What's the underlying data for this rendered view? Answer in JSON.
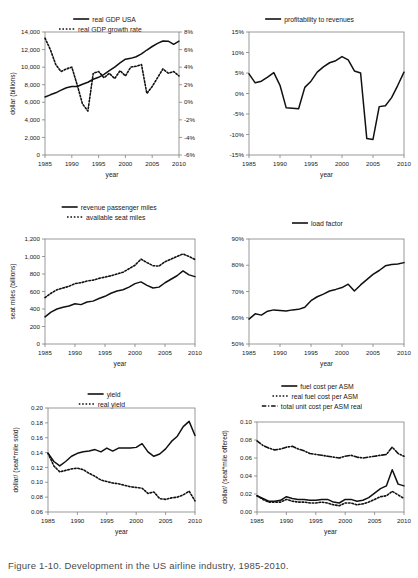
{
  "figure": {
    "caption": "Figure 1-10. Development in the US airline industry, 1985-2010.",
    "background": "#ffffff",
    "line_color": "#111111",
    "axis_color": "#808080",
    "panel_count": 6
  },
  "common": {
    "xlabel": "year",
    "xticks": [
      "1985",
      "1990",
      "1995",
      "2000",
      "2005",
      "2010"
    ],
    "xlim": [
      1985,
      2010
    ]
  },
  "chart_data": [
    {
      "id": "gdp",
      "type": "line",
      "title": "",
      "xlabel": "year",
      "ylabel": "dollar (billions)",
      "y2label": "",
      "xlim": [
        1985,
        2010
      ],
      "ylim": [
        0,
        14000
      ],
      "y2lim": [
        -6,
        8
      ],
      "yticks": [
        "0",
        "2,000",
        "4,000",
        "6,000",
        "8,000",
        "10,000",
        "12,000",
        "14,000"
      ],
      "y2ticks": [
        "-6%",
        "-4%",
        "-2%",
        "0%",
        "2%",
        "4%",
        "6%",
        "8%"
      ],
      "xticks": [
        "1985",
        "1990",
        "1995",
        "2000",
        "2005",
        "2010"
      ],
      "grid": false,
      "legend_position": "top",
      "legend": [
        {
          "label": "real GDP USA",
          "style": "solid",
          "axis": "left"
        },
        {
          "label": "real GDP growth rate",
          "style": "dotted",
          "axis": "right"
        }
      ],
      "x": [
        1985,
        1986,
        1987,
        1988,
        1989,
        1990,
        1991,
        1992,
        1993,
        1994,
        1995,
        1996,
        1997,
        1998,
        1999,
        2000,
        2001,
        2002,
        2003,
        2004,
        2005,
        2006,
        2007,
        2008,
        2009,
        2010
      ],
      "series": [
        {
          "name": "real GDP USA",
          "style": "solid",
          "axis": "left",
          "values": [
            6600,
            6850,
            7080,
            7380,
            7650,
            7800,
            7790,
            8060,
            8280,
            8620,
            8840,
            9180,
            9590,
            10010,
            10480,
            10900,
            11000,
            11180,
            11500,
            11950,
            12350,
            12700,
            12980,
            12950,
            12600,
            12950
          ]
        },
        {
          "name": "real GDP growth rate",
          "style": "dotted",
          "axis": "right",
          "values": [
            7.3,
            6.0,
            4.3,
            3.5,
            3.8,
            4.0,
            2.0,
            -0.2,
            -1.0,
            3.3,
            3.5,
            2.8,
            3.3,
            2.7,
            3.6,
            3.0,
            4.0,
            4.1,
            4.3,
            1.0,
            1.8,
            2.8,
            3.8,
            3.3,
            3.5,
            3.0
          ]
        }
      ],
      "series_note": "growth rate series plotted as dotted markers against right axis"
    },
    {
      "id": "profitability",
      "type": "line",
      "title": "",
      "xlabel": "year",
      "ylabel": "",
      "xlim": [
        1985,
        2010
      ],
      "ylim": [
        -15,
        15
      ],
      "yticks": [
        "-15%",
        "-10%",
        "-5%",
        "0%",
        "5%",
        "10%",
        "15%"
      ],
      "xticks": [
        "1985",
        "1990",
        "1995",
        "2000",
        "2005",
        "2010"
      ],
      "grid": false,
      "legend_position": "top",
      "legend": [
        {
          "label": "profitability to revenues",
          "style": "solid"
        }
      ],
      "x": [
        1985,
        1986,
        1987,
        1988,
        1989,
        1990,
        1991,
        1992,
        1993,
        1994,
        1995,
        1996,
        1997,
        1998,
        1999,
        2000,
        2001,
        2002,
        2003,
        2004,
        2005,
        2006,
        2007,
        2008,
        2009,
        2010
      ],
      "series": [
        {
          "name": "profitability to revenues",
          "style": "solid",
          "values": [
            4.8,
            2.6,
            3.0,
            4.0,
            5.1,
            2.0,
            -3.5,
            -3.6,
            -3.7,
            1.5,
            3.0,
            5.2,
            6.5,
            7.5,
            8.0,
            9.0,
            8.2,
            5.5,
            5.0,
            -11.0,
            -11.2,
            -3.2,
            -3.0,
            -1.0,
            2.0,
            5.2,
            3.0,
            -3.8,
            -0.2,
            1.2
          ]
        }
      ]
    },
    {
      "id": "traffic",
      "type": "line",
      "title": "",
      "xlabel": "year",
      "ylabel": "seat miles (billions)",
      "xlim": [
        1985,
        2010
      ],
      "ylim": [
        0,
        1200
      ],
      "yticks": [
        "0",
        "200",
        "400",
        "600",
        "800",
        "1,000",
        "1,200"
      ],
      "xticks": [
        "1985",
        "1990",
        "1995",
        "2000",
        "2005",
        "2010"
      ],
      "grid": false,
      "legend_position": "top",
      "legend": [
        {
          "label": "revenue passenger miles",
          "style": "solid"
        },
        {
          "label": "available seat miles",
          "style": "dotted"
        }
      ],
      "x": [
        1985,
        1986,
        1987,
        1988,
        1989,
        1990,
        1991,
        1992,
        1993,
        1994,
        1995,
        1996,
        1997,
        1998,
        1999,
        2000,
        2001,
        2002,
        2003,
        2004,
        2005,
        2006,
        2007,
        2008,
        2009,
        2010
      ],
      "series": [
        {
          "name": "revenue passenger miles",
          "style": "solid",
          "values": [
            310,
            365,
            400,
            420,
            435,
            460,
            450,
            480,
            490,
            520,
            545,
            580,
            605,
            620,
            650,
            690,
            710,
            670,
            640,
            650,
            700,
            740,
            780,
            835,
            790,
            770
          ]
        },
        {
          "name": "available seat miles",
          "style": "dotted",
          "values": [
            530,
            580,
            620,
            640,
            660,
            690,
            700,
            720,
            730,
            750,
            765,
            780,
            800,
            820,
            860,
            900,
            970,
            930,
            895,
            890,
            940,
            970,
            1000,
            1030,
            1000,
            965
          ]
        }
      ]
    },
    {
      "id": "loadfactor",
      "type": "line",
      "title": "",
      "xlabel": "year",
      "ylabel": "",
      "xlim": [
        1985,
        2010
      ],
      "ylim": [
        50,
        90
      ],
      "yticks": [
        "50%",
        "60%",
        "70%",
        "80%",
        "90%"
      ],
      "xticks": [
        "1985",
        "1990",
        "1995",
        "2000",
        "2005",
        "2010"
      ],
      "grid": false,
      "legend_position": "top",
      "legend": [
        {
          "label": "load factor",
          "style": "solid"
        }
      ],
      "x": [
        1985,
        1986,
        1987,
        1988,
        1989,
        1990,
        1991,
        1992,
        1993,
        1994,
        1995,
        1996,
        1997,
        1998,
        1999,
        2000,
        2001,
        2002,
        2003,
        2004,
        2005,
        2006,
        2007,
        2008,
        2009,
        2010
      ],
      "series": [
        {
          "name": "load factor",
          "style": "solid",
          "values": [
            59.5,
            61.5,
            61.0,
            62.5,
            63.0,
            62.8,
            62.6,
            63.0,
            63.2,
            64.0,
            66.5,
            68.0,
            69.0,
            70.2,
            70.8,
            71.5,
            72.8,
            70.2,
            72.5,
            74.5,
            76.5,
            78.0,
            79.8,
            80.3,
            80.5,
            81.0
          ]
        }
      ]
    },
    {
      "id": "yield",
      "type": "line",
      "title": "",
      "xlabel": "year",
      "ylabel": "dollar/ (seat*mile sold)",
      "xlim": [
        1985,
        2010
      ],
      "ylim": [
        0.06,
        0.2
      ],
      "yticks": [
        "0.06",
        "0.08",
        "0.10",
        "0.12",
        "0.14",
        "0.16",
        "0.18",
        "0.20"
      ],
      "xticks": [
        "1985",
        "1990",
        "1995",
        "2000",
        "2005",
        "2010"
      ],
      "grid": false,
      "legend_position": "top",
      "legend": [
        {
          "label": "yield",
          "style": "solid"
        },
        {
          "label": "real yield",
          "style": "dotted"
        }
      ],
      "x": [
        1985,
        1986,
        1987,
        1988,
        1989,
        1990,
        1991,
        1992,
        1993,
        1994,
        1995,
        1996,
        1997,
        1998,
        1999,
        2000,
        2001,
        2002,
        2003,
        2004,
        2005,
        2006,
        2007,
        2008,
        2009,
        2010
      ],
      "series": [
        {
          "name": "yield",
          "style": "solid",
          "values": [
            0.139,
            0.128,
            0.122,
            0.128,
            0.135,
            0.139,
            0.141,
            0.142,
            0.144,
            0.141,
            0.146,
            0.142,
            0.146,
            0.146,
            0.146,
            0.147,
            0.152,
            0.141,
            0.135,
            0.138,
            0.145,
            0.155,
            0.162,
            0.175,
            0.182,
            0.163
          ]
        },
        {
          "name": "real yield",
          "style": "dotted",
          "values": [
            0.139,
            0.122,
            0.114,
            0.116,
            0.118,
            0.119,
            0.117,
            0.112,
            0.108,
            0.103,
            0.101,
            0.099,
            0.098,
            0.096,
            0.094,
            0.093,
            0.092,
            0.085,
            0.087,
            0.078,
            0.077,
            0.079,
            0.08,
            0.083,
            0.088,
            0.075
          ]
        }
      ]
    },
    {
      "id": "cost",
      "type": "line",
      "title": "",
      "xlabel": "year",
      "ylabel": "dollar/ (seat*mile offered)",
      "xlim": [
        1985,
        2010
      ],
      "ylim": [
        0.0,
        0.1
      ],
      "yticks": [
        "0.00",
        "0.02",
        "0.04",
        "0.06",
        "0.08",
        "0.10"
      ],
      "xticks": [
        "1985",
        "1990",
        "1995",
        "2000",
        "2005",
        "2010"
      ],
      "grid": false,
      "legend_position": "top",
      "legend": [
        {
          "label": "fuel cost per ASM",
          "style": "solid"
        },
        {
          "label": "real fuel cost per ASM",
          "style": "dotted"
        },
        {
          "label": "total unit cost per ASM real",
          "style": "dashed"
        }
      ],
      "x": [
        1985,
        1986,
        1987,
        1988,
        1989,
        1990,
        1991,
        1992,
        1993,
        1994,
        1995,
        1996,
        1997,
        1998,
        1999,
        2000,
        2001,
        2002,
        2003,
        2004,
        2005,
        2006,
        2007,
        2008,
        2009,
        2010
      ],
      "series": [
        {
          "name": "fuel cost per ASM",
          "style": "solid",
          "values": [
            0.018,
            0.015,
            0.012,
            0.012,
            0.013,
            0.017,
            0.015,
            0.014,
            0.014,
            0.013,
            0.013,
            0.014,
            0.014,
            0.011,
            0.01,
            0.014,
            0.014,
            0.012,
            0.013,
            0.016,
            0.021,
            0.026,
            0.029,
            0.047,
            0.031,
            0.029
          ]
        },
        {
          "name": "real fuel cost per ASM",
          "style": "dotted",
          "values": [
            0.018,
            0.014,
            0.011,
            0.011,
            0.011,
            0.014,
            0.012,
            0.011,
            0.011,
            0.01,
            0.01,
            0.011,
            0.01,
            0.008,
            0.007,
            0.01,
            0.01,
            0.008,
            0.009,
            0.011,
            0.014,
            0.017,
            0.018,
            0.023,
            0.019,
            0.015
          ]
        },
        {
          "name": "total unit cost per ASM real",
          "style": "dashed",
          "values": [
            0.079,
            0.074,
            0.071,
            0.069,
            0.07,
            0.072,
            0.073,
            0.07,
            0.068,
            0.065,
            0.064,
            0.063,
            0.062,
            0.061,
            0.06,
            0.062,
            0.063,
            0.061,
            0.06,
            0.061,
            0.062,
            0.063,
            0.064,
            0.072,
            0.065,
            0.062
          ]
        }
      ]
    }
  ]
}
